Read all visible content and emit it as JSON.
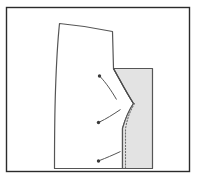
{
  "figure": {
    "canvas": {
      "width": 200,
      "height": 181,
      "background": "#ffffff"
    },
    "frame": {
      "label": "illustration-border",
      "x": 6.5,
      "y": 7.5,
      "width": 183,
      "height": 164,
      "stroke": "#2b2b2b",
      "stroke_width": 1.4,
      "fill": "#ffffff"
    },
    "shapes": {
      "main_piece": {
        "label": "main-pattern-piece",
        "fill": "#ffffff",
        "stroke": "#555555",
        "stroke_width": 1.2,
        "path": "M 59.5 23.5 C 76 25 96 28 112.5 31.5 L 113.5 68.5 C 120 80 126 92 133.5 103.5 C 129 110 125.5 118 122.5 128.5 L 122.5 168.5 L 54.5 168.5 C 54.5 140 54.8 110 55.5 90 C 56.3 66 57.8 40 59.5 23.5 Z"
      },
      "facing_piece": {
        "label": "shaded-facing-piece",
        "fill": "#e3e3e3",
        "stroke": "#555555",
        "stroke_width": 1.2,
        "path": "M 113.5 68.5 L 152.5 68.5 L 152.5 168.5 L 122.5 168.5 L 122.5 128.5 C 125.5 118 129 110 133.5 103.5 C 126 92 120 80 113.5 68.5 Z"
      },
      "curve_seam": {
        "label": "curved-seam-line",
        "stroke": "#4a4a4a",
        "stroke_width": 1.2,
        "path": "M 113.5 68.5 C 120 80 126 92 133.5 103.5"
      },
      "stitch_line": {
        "label": "dotted-stitch-line",
        "stroke": "#6d6d6d",
        "stroke_width": 1.1,
        "dash": "1.2 1.9",
        "path": "M 134.5 103.5 C 130 111 127 119 125.5 129 L 125.5 167.5"
      }
    },
    "leaders": [
      {
        "label": "leader-line-upper",
        "dot": {
          "cx": 99.5,
          "cy": 76.0,
          "r": 1.7
        },
        "path": "M 100.5 77.0 C 106 83 111 90 116.5 99.5",
        "stroke": "#555555",
        "stroke_width": 1.0,
        "dot_fill": "#3a3a3a"
      },
      {
        "label": "leader-line-middle",
        "dot": {
          "cx": 98.5,
          "cy": 122.5,
          "r": 1.7
        },
        "path": "M 99.5 122.0 C 106 119 113 114.5 120.5 109.5",
        "stroke": "#555555",
        "stroke_width": 1.0,
        "dot_fill": "#3a3a3a"
      },
      {
        "label": "leader-line-lower",
        "dot": {
          "cx": 98.5,
          "cy": 161.0,
          "r": 1.7
        },
        "path": "M 99.5 160.5 C 106 158 113 155 120.5 151.5",
        "stroke": "#555555",
        "stroke_width": 1.0,
        "dot_fill": "#3a3a3a"
      }
    ]
  }
}
